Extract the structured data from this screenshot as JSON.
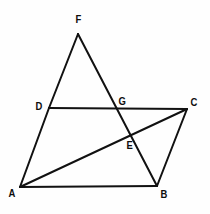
{
  "figure": {
    "canvas": {
      "width": 210,
      "height": 214
    },
    "style": {
      "background_color": "#fefefe",
      "line_color": "#111111",
      "label_color": "#0d0d0d",
      "line_width": 2
    },
    "points": [
      {
        "id": "A",
        "label": "A",
        "x": 20,
        "y": 187,
        "label_x": 8,
        "label_y": 188
      },
      {
        "id": "B",
        "label": "B",
        "x": 157,
        "y": 186,
        "label_x": 160,
        "label_y": 189
      },
      {
        "id": "C",
        "label": "C",
        "x": 187,
        "y": 109,
        "label_x": 190,
        "label_y": 97
      },
      {
        "id": "D",
        "label": "D",
        "x": 49,
        "y": 108,
        "label_x": 35,
        "label_y": 101
      },
      {
        "id": "E",
        "label": "E",
        "x": 128,
        "y": 136,
        "label_x": 126,
        "label_y": 140
      },
      {
        "id": "F",
        "label": "F",
        "x": 78,
        "y": 34,
        "label_x": 75,
        "label_y": 14
      },
      {
        "id": "G",
        "label": "G",
        "x": 119,
        "y": 108,
        "label_x": 118,
        "label_y": 96
      }
    ],
    "segments": [
      {
        "id": "seg-AB",
        "name": "side-ab",
        "from": "A",
        "to": "B"
      },
      {
        "id": "seg-BC",
        "name": "side-bc",
        "from": "B",
        "to": "C"
      },
      {
        "id": "seg-CD",
        "name": "side-dc",
        "from": "C",
        "to": "D"
      },
      {
        "id": "seg-DA",
        "name": "side-ad",
        "from": "D",
        "to": "A"
      },
      {
        "id": "seg-AC",
        "name": "diagonal-ac",
        "from": "A",
        "to": "C"
      },
      {
        "id": "seg-FD",
        "name": "line-fd",
        "from": "F",
        "to": "D"
      },
      {
        "id": "seg-FB",
        "name": "line-fb",
        "from": "F",
        "to": "B"
      }
    ]
  }
}
